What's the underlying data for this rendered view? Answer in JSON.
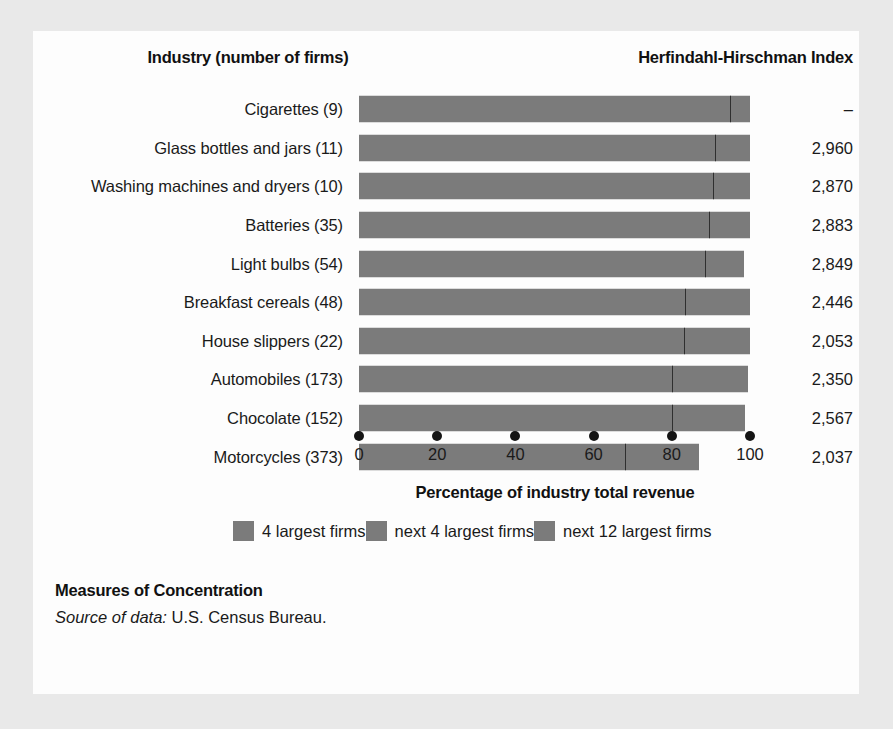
{
  "headers": {
    "industry": "Industry (number of firms)",
    "hhi": "Herfindahl-Hirschman Index"
  },
  "caption": {
    "title": "Measures of Concentration",
    "source_label": "Source of data:",
    "source_value": "U.S. Census Bureau."
  },
  "legend": {
    "items": [
      {
        "label": "4 largest firms",
        "color": "#7b7b7b"
      },
      {
        "label": "next 4 largest firms",
        "color": "#7b7b7b"
      },
      {
        "label": "next 12 largest firms",
        "color": "#7b7b7b"
      }
    ]
  },
  "chart_data": {
    "type": "bar",
    "orientation": "horizontal",
    "stacked": true,
    "title": "Measures of Concentration",
    "xlabel": "Percentage of industry total revenue",
    "ylabel": "Industry (number of firms)",
    "xlim": [
      0,
      100
    ],
    "xticks": [
      0,
      20,
      40,
      60,
      80,
      100
    ],
    "xticklabels": [
      "0",
      "20",
      "40",
      "60",
      "80",
      "100"
    ],
    "grid": false,
    "legend_position": "bottom",
    "series": [
      {
        "name": "4 largest firms",
        "values": [
          95.0,
          91.0,
          90.5,
          89.5,
          88.5,
          83.5,
          83.0,
          80.0,
          80.0,
          68.0
        ]
      },
      {
        "name": "next 4 largest firms",
        "values": [
          0.0,
          0.0,
          0.0,
          0.0,
          0.0,
          0.0,
          0.0,
          0.0,
          0.0,
          0.0
        ]
      },
      {
        "name": "next 12 largest firms",
        "values": [
          5.0,
          9.0,
          9.5,
          10.5,
          10.0,
          16.5,
          17.0,
          20.0,
          18.7,
          19.0
        ]
      }
    ],
    "categories": [
      "Cigarettes  (9)",
      "Glass bottles and jars  (11)",
      "Washing machines and dryers  (10)",
      "Batteries  (35)",
      "Light bulbs  (54)",
      "Breakfast cereals  (48)",
      "House slippers  (22)",
      "Automobiles  (173)",
      "Chocolate  (152)",
      "Motorcycles  (373)"
    ],
    "rows": [
      {
        "label": "Cigarettes  (9)",
        "seg1": 95.0,
        "seg2": 0.0,
        "seg3": 5.0,
        "total": 100.0,
        "hhi": "–"
      },
      {
        "label": "Glass bottles and jars  (11)",
        "seg1": 91.0,
        "seg2": 0.0,
        "seg3": 9.0,
        "total": 100.0,
        "hhi": "2,960"
      },
      {
        "label": "Washing machines and dryers  (10)",
        "seg1": 90.5,
        "seg2": 0.0,
        "seg3": 9.5,
        "total": 100.0,
        "hhi": "2,870"
      },
      {
        "label": "Batteries  (35)",
        "seg1": 89.5,
        "seg2": 0.0,
        "seg3": 10.5,
        "total": 100.0,
        "hhi": "2,883"
      },
      {
        "label": "Light bulbs  (54)",
        "seg1": 88.5,
        "seg2": 0.0,
        "seg3": 10.0,
        "total": 98.5,
        "hhi": "2,849"
      },
      {
        "label": "Breakfast cereals  (48)",
        "seg1": 83.5,
        "seg2": 0.0,
        "seg3": 16.5,
        "total": 100.0,
        "hhi": "2,446"
      },
      {
        "label": "House slippers  (22)",
        "seg1": 83.0,
        "seg2": 0.0,
        "seg3": 17.0,
        "total": 100.0,
        "hhi": "2,053"
      },
      {
        "label": "Automobiles  (173)",
        "seg1": 80.0,
        "seg2": 0.0,
        "seg3": 19.5,
        "total": 99.5,
        "hhi": "2,350"
      },
      {
        "label": "Chocolate  (152)",
        "seg1": 80.0,
        "seg2": 0.0,
        "seg3": 18.7,
        "total": 98.7,
        "hhi": "2,567"
      },
      {
        "label": "Motorcycles  (373)",
        "seg1": 68.0,
        "seg2": 0.0,
        "seg3": 19.0,
        "total": 87.0,
        "hhi": "2,037"
      }
    ]
  }
}
